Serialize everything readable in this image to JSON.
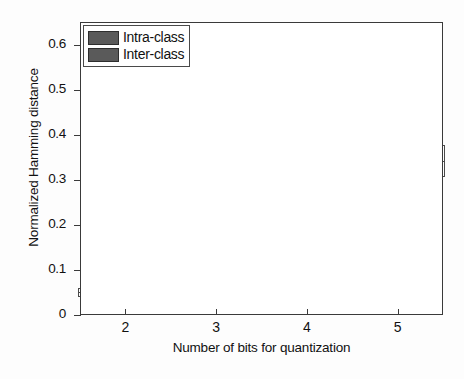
{
  "chart_data": {
    "type": "box",
    "title": "",
    "xlabel": "Number of bits for quantization",
    "ylabel": "Normalized Hamming distance",
    "xlim": [
      1.5,
      5.5
    ],
    "ylim": [
      0,
      0.65
    ],
    "x_ticks": [
      "2",
      "3",
      "4",
      "5"
    ],
    "x_tick_values": [
      2,
      3,
      4,
      5
    ],
    "y_ticks": [
      "0",
      "0.1",
      "0.2",
      "0.3",
      "0.4",
      "0.5",
      "0.6"
    ],
    "y_tick_values": [
      0,
      0.1,
      0.2,
      0.3,
      0.4,
      0.5,
      0.6
    ],
    "grid": true,
    "legend_position": "upper-left",
    "legend": [
      "Intra-class",
      "Inter-class"
    ],
    "series": [
      {
        "name": "Intra-class",
        "color": "#5a5a5a",
        "boxes": [
          {
            "x": 2,
            "whisker_low": 0.005,
            "q1": 0.04,
            "median": 0.05,
            "q3": 0.06,
            "whisker_high": 0.08,
            "outliers": [
              0.088,
              0.09,
              0.092,
              0.094,
              0.096,
              0.098,
              0.1
            ]
          },
          {
            "x": 3,
            "whisker_low": 0.002,
            "q1": 0.05,
            "median": 0.058,
            "q3": 0.068,
            "whisker_high": 0.095,
            "outliers": [
              0.1,
              0.102,
              0.104,
              0.106,
              0.108
            ]
          },
          {
            "x": 4,
            "whisker_low": 0.015,
            "q1": 0.068,
            "median": 0.079,
            "q3": 0.09,
            "whisker_high": 0.113,
            "outliers": [
              0.12,
              0.126,
              0.13,
              0.134,
              0.138,
              0.142,
              0.146,
              0.15,
              0.155
            ]
          },
          {
            "x": 5,
            "whisker_low": 0.04,
            "q1": 0.103,
            "median": 0.12,
            "q3": 0.138,
            "whisker_high": 0.18,
            "outliers": [
              0.19,
              0.196,
              0.202,
              0.206,
              0.21,
              0.214,
              0.218,
              0.222
            ]
          }
        ]
      },
      {
        "name": "Inter-class",
        "color": "#5a5a5a",
        "boxes": [
          {
            "x": 2,
            "whisker_low": 0.052,
            "q1": 0.125,
            "median": 0.152,
            "q3": 0.175,
            "whisker_high": 0.25,
            "outliers": [
              0.258,
              0.264,
              0.27,
              0.275,
              0.28,
              0.285,
              0.29,
              0.294,
              0.298,
              0.302,
              0.308,
              0.315
            ]
          },
          {
            "x": 3,
            "whisker_low": 0.078,
            "q1": 0.182,
            "median": 0.215,
            "q3": 0.245,
            "whisker_high": 0.348,
            "outliers": [
              0.355,
              0.362,
              0.37,
              0.378,
              0.386,
              0.392,
              0.398,
              0.404,
              0.41,
              0.416,
              0.422,
              0.43,
              0.44,
              0.455
            ]
          },
          {
            "x": 4,
            "whisker_low": 0.108,
            "q1": 0.248,
            "median": 0.288,
            "q3": 0.322,
            "whisker_high": 0.44,
            "outliers": [
              0.446,
              0.452,
              0.458,
              0.464,
              0.47,
              0.476,
              0.482,
              0.488,
              0.494,
              0.5,
              0.506
            ]
          },
          {
            "x": 5,
            "whisker_low": 0.162,
            "q1": 0.305,
            "median": 0.342,
            "q3": 0.378,
            "whisker_high": 0.485,
            "outliers": [
              0.49,
              0.496,
              0.502,
              0.508,
              0.514,
              0.52,
              0.526,
              0.532,
              0.538
            ]
          }
        ]
      }
    ]
  },
  "colors": {
    "axis": "#3a3a3a",
    "grid": "#9a9a9a",
    "box_line": "#4a4a4a",
    "legend_swatch": "#5a5a5a",
    "background": "#ffffff"
  }
}
